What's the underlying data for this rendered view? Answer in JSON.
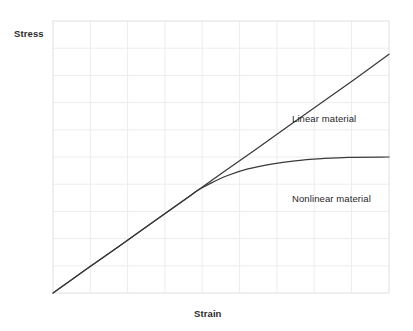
{
  "chart_data": {
    "type": "line",
    "title": "",
    "subtitle": "",
    "xlabel": "Strain",
    "ylabel": "Stress",
    "grid": true,
    "grid_columns": 9,
    "grid_rows": 10,
    "axis_ticks": [],
    "legend_position": "inline-annotation",
    "xlim": [
      0,
      1
    ],
    "ylim": [
      0,
      1
    ],
    "annotations": [
      {
        "name": "linear-material-label",
        "text": "Linear material",
        "x": 0.72,
        "y": 0.66
      },
      {
        "name": "nonlinear-material-label",
        "text": "Nonlinear material",
        "x": 0.72,
        "y": 0.37
      }
    ],
    "series": [
      {
        "name": "Linear material",
        "color": "#3a3a3a",
        "x": [
          0.0,
          0.1,
          0.2,
          0.3,
          0.4,
          0.43,
          0.5,
          0.6,
          0.7,
          0.8,
          0.9,
          1.0
        ],
        "y": [
          0.0,
          0.088,
          0.175,
          0.263,
          0.35,
          0.377,
          0.438,
          0.525,
          0.613,
          0.7,
          0.788,
          0.878
        ]
      },
      {
        "name": "Nonlinear material",
        "color": "#3a3a3a",
        "x": [
          0.0,
          0.1,
          0.2,
          0.3,
          0.4,
          0.43,
          0.47,
          0.52,
          0.58,
          0.65,
          0.72,
          0.8,
          0.88,
          1.0
        ],
        "y": [
          0.0,
          0.088,
          0.175,
          0.263,
          0.35,
          0.377,
          0.404,
          0.432,
          0.456,
          0.474,
          0.486,
          0.494,
          0.499,
          0.5
        ]
      }
    ]
  },
  "colors": {
    "background": "#ffffff",
    "curve": "#3a3a3a",
    "grid_line": "#ededed",
    "plot_border": "#e2e2e2",
    "text": "#1f1f1f",
    "axis_label_text": "#2b2b2b"
  }
}
